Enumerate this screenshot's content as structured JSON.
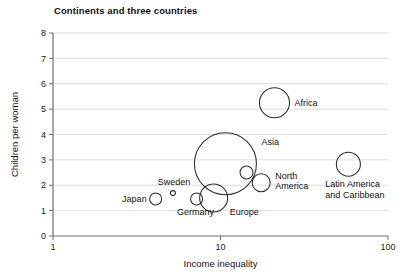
{
  "chart_data": {
    "type": "scatter",
    "title": "Continents and three countries",
    "xlabel": "Income inequality",
    "ylabel": "Children per woman",
    "xscale": "log",
    "xlim": [
      1,
      100
    ],
    "ylim": [
      0,
      8
    ],
    "xticks": [
      "1",
      "10",
      "100"
    ],
    "xtick_values": [
      1,
      10,
      100
    ],
    "yticks": [
      "0",
      "1",
      "2",
      "3",
      "4",
      "5",
      "6",
      "7",
      "8"
    ],
    "ytick_values": [
      0,
      1,
      2,
      3,
      4,
      5,
      6,
      7,
      8
    ],
    "grid": "horizontal",
    "legend": "none",
    "size_encoding": "population",
    "points": [
      {
        "label": "Africa",
        "x": 21.0,
        "y": 5.25,
        "r_px": 15.0,
        "label_dx": 20,
        "label_dy": 3,
        "label_anchor": "start"
      },
      {
        "label": "Asia",
        "x": 10.7,
        "y": 2.85,
        "r_px": 31.0,
        "label_dx": 36,
        "label_dy": -19,
        "label_anchor": "start"
      },
      {
        "label": "Europe",
        "x": 9.1,
        "y": 1.5,
        "r_px": 14.0,
        "label_dx": 16,
        "label_dy": 17,
        "label_anchor": "start"
      },
      {
        "label": "North America",
        "x": 17.5,
        "y": 2.1,
        "r_px": 9.0,
        "label_dx": 14,
        "label_dy": -4,
        "label_anchor": "start",
        "label_lines": [
          "North",
          "America"
        ]
      },
      {
        "label": "Latin America and Caribbean",
        "x": 58.0,
        "y": 2.83,
        "r_px": 12.0,
        "label_dx": -23,
        "label_dy": 23,
        "label_anchor": "start",
        "label_lines": [
          "Latin America",
          "and Caribbean"
        ]
      },
      {
        "label": "Japan",
        "x": 4.1,
        "y": 1.46,
        "r_px": 6.0,
        "label_dx": -9,
        "label_dy": 3,
        "label_anchor": "end"
      },
      {
        "label": "Sweden",
        "x": 5.2,
        "y": 1.69,
        "r_px": 2.5,
        "label_dx": 1,
        "label_dy": -8,
        "label_anchor": "middle"
      },
      {
        "label": "Germany",
        "x": 7.2,
        "y": 1.46,
        "r_px": 6.0,
        "label_dx": -1,
        "label_dy": 16,
        "label_anchor": "middle"
      },
      {
        "label": "",
        "x": 14.3,
        "y": 2.5,
        "r_px": 6.5,
        "label_dx": 0,
        "label_dy": 0,
        "label_anchor": "middle"
      }
    ]
  },
  "colors": {
    "bubble_stroke": "#2b2b2b",
    "axis": "#6e6e6e",
    "grid": "#d8d8d8",
    "text": "#111111",
    "background": "#ffffff"
  }
}
